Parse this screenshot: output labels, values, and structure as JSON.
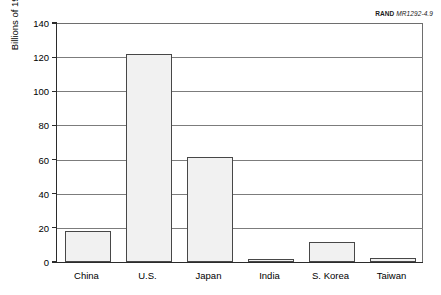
{
  "source": {
    "organization": "RAND",
    "document_id": "MR1292-4.9"
  },
  "chart_data": {
    "type": "bar",
    "title": "",
    "subtitle": "",
    "xlabel": "",
    "ylabel": "Billions of 1996 PPP dollars",
    "categories": [
      "China",
      "U.S.",
      "Japan",
      "India",
      "S. Korea",
      "Taiwan"
    ],
    "values": [
      18,
      122,
      61.5,
      1.5,
      12,
      2.5
    ],
    "ylim": [
      0,
      140
    ],
    "ytick_step": 20,
    "yticks": [
      0,
      20,
      40,
      60,
      80,
      100,
      120,
      140
    ],
    "ytick_labels": [
      "0",
      "20",
      "40",
      "60",
      "80",
      "100",
      "120",
      "140"
    ],
    "grid": "horizontal",
    "legend": "none",
    "bar_fill_color": "#f1f1f1",
    "bar_border_color": "#474747",
    "gridline_color": "#7c7c7c",
    "axis_color": "#2b2b2b"
  }
}
